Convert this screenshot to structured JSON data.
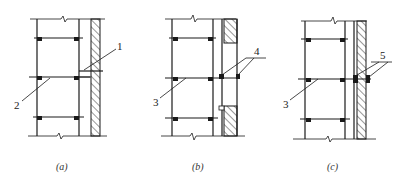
{
  "figure": {
    "panels": [
      {
        "id": "a",
        "caption": "(a)",
        "callouts": [
          {
            "number": "1",
            "target": "rigid tie rod to wall"
          },
          {
            "number": "2",
            "target": "ledger / horizontal tube"
          }
        ]
      },
      {
        "id": "b",
        "caption": "(b)",
        "callouts": [
          {
            "number": "4",
            "target": "clamp anchors through wall opening"
          },
          {
            "number": "3",
            "target": "ledger / horizontal tube"
          }
        ]
      },
      {
        "id": "c",
        "caption": "(c)",
        "callouts": [
          {
            "number": "5",
            "target": "through-wall bolt clamps"
          },
          {
            "number": "3",
            "target": "ledger / horizontal tube"
          }
        ]
      }
    ],
    "colors": {
      "line": "#1a1a1a",
      "background": "#ffffff"
    }
  }
}
